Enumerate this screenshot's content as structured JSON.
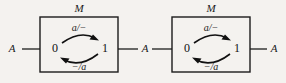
{
  "figure": {
    "width": 286,
    "height": 83,
    "background_color": "#f4f2ef",
    "ink_color": "#1c1c1c"
  },
  "machines": [
    {
      "id": "machine-left",
      "label": "M",
      "box": {
        "x": 40,
        "y": 17,
        "width": 78,
        "height": 55
      },
      "states": [
        {
          "name": "state-0",
          "label": "0",
          "x": 55,
          "y": 49
        },
        {
          "name": "state-1",
          "label": "1",
          "x": 105,
          "y": 49
        }
      ],
      "transitions": [
        {
          "name": "transition-zero-to-one",
          "label": "a/−",
          "direction": "left-to-right",
          "label_x": 79,
          "label_y": 33
        },
        {
          "name": "transition-one-to-zero",
          "label": "−/a",
          "direction": "right-to-left",
          "label_x": 79,
          "label_y": 69
        }
      ]
    },
    {
      "id": "machine-right",
      "label": "M",
      "box": {
        "x": 172,
        "y": 17,
        "width": 78,
        "height": 55
      },
      "states": [
        {
          "name": "state-0",
          "label": "0",
          "x": 187,
          "y": 49
        },
        {
          "name": "state-1",
          "label": "1",
          "x": 237,
          "y": 49
        }
      ],
      "transitions": [
        {
          "name": "transition-zero-to-one",
          "label": "a/−",
          "direction": "left-to-right",
          "label_x": 211,
          "label_y": 33
        },
        {
          "name": "transition-one-to-zero",
          "label": "−/a",
          "direction": "right-to-left",
          "label_x": 211,
          "label_y": 69
        }
      ]
    }
  ],
  "signals": [
    {
      "name": "signal-input-left",
      "label": "A",
      "x": 12,
      "y": 49
    },
    {
      "name": "signal-middle",
      "label": "A",
      "x": 145,
      "y": 49
    },
    {
      "name": "signal-output-right",
      "label": "A",
      "x": 274,
      "y": 49
    }
  ]
}
